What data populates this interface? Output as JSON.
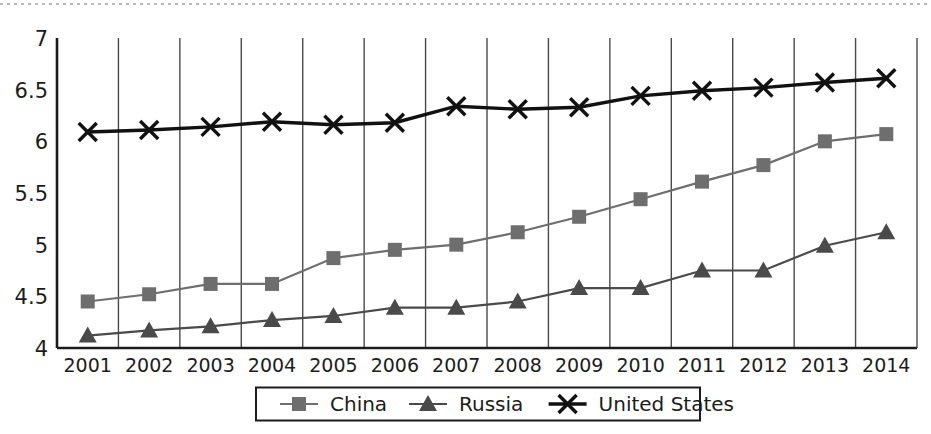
{
  "chart_data": {
    "type": "line",
    "title": "",
    "subtitle": "",
    "xlabel": "",
    "ylabel": "",
    "categories": [
      "2001",
      "2002",
      "2003",
      "2004",
      "2005",
      "2006",
      "2007",
      "2008",
      "2009",
      "2010",
      "2011",
      "2012",
      "2013",
      "2014"
    ],
    "ylim": [
      4,
      7
    ],
    "yticks": [
      4,
      4.5,
      5,
      5.5,
      6,
      6.5,
      7
    ],
    "ytick_labels": [
      "4",
      "4.5",
      "5",
      "5.5",
      "6",
      "6.5",
      "7"
    ],
    "grid": "vertical",
    "legend_position": "bottom",
    "series": [
      {
        "name": "China",
        "marker": "square",
        "color": "#6e6e6e",
        "values": [
          4.45,
          4.52,
          4.62,
          4.62,
          4.87,
          4.95,
          5.0,
          5.12,
          5.27,
          5.44,
          5.61,
          5.77,
          6.0,
          6.07
        ]
      },
      {
        "name": "Russia",
        "marker": "triangle",
        "color": "#4a4a4a",
        "values": [
          4.12,
          4.17,
          4.21,
          4.27,
          4.31,
          4.39,
          4.39,
          4.45,
          4.58,
          4.58,
          4.75,
          4.75,
          4.99,
          5.12
        ]
      },
      {
        "name": "United States",
        "marker": "cross",
        "color": "#111111",
        "values": [
          6.09,
          6.11,
          6.14,
          6.19,
          6.16,
          6.18,
          6.34,
          6.31,
          6.33,
          6.44,
          6.49,
          6.52,
          6.57,
          6.61
        ]
      }
    ]
  },
  "legend": {
    "items": [
      {
        "label": "China",
        "marker": "square-marker"
      },
      {
        "label": "Russia",
        "marker": "triangle-marker"
      },
      {
        "label": "United States",
        "marker": "cross-marker"
      }
    ]
  },
  "colors": {
    "axis": "#1c1c1c",
    "grid": "#4a4a4a",
    "background": "#ffffff",
    "china": "#6e6e6e",
    "russia": "#4a4a4a",
    "united_states": "#111111"
  }
}
